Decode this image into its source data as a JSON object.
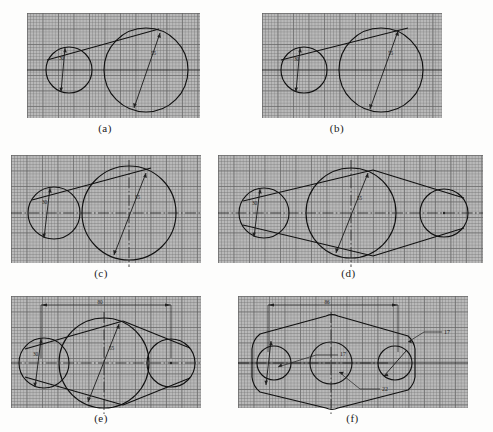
{
  "figure": {
    "background_color": "#b9b9b9",
    "line_color": "#111111",
    "panel_count": 6
  },
  "panels": [
    {
      "id": "a",
      "caption": "(a)",
      "description": "Two circles with single upper tangent line and plain horizontal centerline",
      "circles": [
        {
          "name": "small-circle",
          "diameter_label": "30"
        },
        {
          "name": "large-circle",
          "diameter_label": "55"
        }
      ],
      "centerline_style": "plain",
      "tangents": [
        "upper"
      ],
      "third_circle": false,
      "dimension_line": false,
      "leaders": []
    },
    {
      "id": "b",
      "caption": "(b)",
      "description": "Two circles with upper tangent extended across both, plain centerline",
      "circles": [
        {
          "name": "small-circle",
          "diameter_label": "30"
        },
        {
          "name": "large-circle",
          "diameter_label": "55"
        }
      ],
      "centerline_style": "plain",
      "tangents": [
        "upper"
      ],
      "third_circle": false,
      "dimension_line": false,
      "leaders": []
    },
    {
      "id": "c",
      "caption": "(c)",
      "description": "Two circles with dash-dot centerlines and vertical centerline on large circle",
      "circles": [
        {
          "name": "small-circle",
          "diameter_label": "30"
        },
        {
          "name": "large-circle",
          "diameter_label": "55"
        }
      ],
      "centerline_style": "dash-dot",
      "tangents": [
        "upper"
      ],
      "third_circle": false,
      "dimension_line": false,
      "leaders": []
    },
    {
      "id": "d",
      "caption": "(d)",
      "description": "Three circles joined by upper and lower tangent lines forming a lens outline",
      "circles": [
        {
          "name": "small-circle-left",
          "diameter_label": "30"
        },
        {
          "name": "large-circle-center",
          "diameter_label": "55"
        },
        {
          "name": "small-circle-right",
          "diameter_label": ""
        }
      ],
      "centerline_style": "dash-dot",
      "tangents": [
        "upper",
        "lower"
      ],
      "third_circle": true,
      "dimension_line": false,
      "leaders": []
    },
    {
      "id": "e",
      "caption": "(e)",
      "description": "Three tangent circles with overall horizontal dimension added",
      "circles": [
        {
          "name": "small-circle-left",
          "diameter_label": "30"
        },
        {
          "name": "large-circle-center",
          "diameter_label": "55"
        },
        {
          "name": "small-circle-right",
          "diameter_label": ""
        }
      ],
      "centerline_style": "dash-dot",
      "tangents": [
        "upper",
        "lower"
      ],
      "third_circle": true,
      "dimension_line": true,
      "dimension_value": "80",
      "leaders": []
    },
    {
      "id": "f",
      "caption": "(f)",
      "description": "Finished plate outline with three bores and leader callouts",
      "circles": [
        {
          "name": "bore-left",
          "diameter_label": ""
        },
        {
          "name": "bore-center",
          "diameter_label": ""
        },
        {
          "name": "bore-right",
          "diameter_label": ""
        }
      ],
      "centerline_style": "dash-dot",
      "tangents": [
        "outline"
      ],
      "third_circle": true,
      "dimension_line": true,
      "dimension_value": "86",
      "leaders": [
        {
          "name": "leader-left-17",
          "label": "17"
        },
        {
          "name": "leader-center-22",
          "label": "22"
        },
        {
          "name": "leader-right-17",
          "label": "17"
        }
      ]
    }
  ]
}
